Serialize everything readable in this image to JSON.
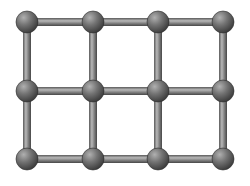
{
  "diagram": {
    "type": "square-lattice",
    "columns": 4,
    "rows": 3,
    "column_x": [
      27,
      93,
      158,
      223
    ],
    "row_y": [
      22,
      91,
      159
    ],
    "node_radius": 11,
    "bond_width": 8,
    "colors": {
      "background": "#ffffff",
      "node_light": "#a8a8a8",
      "node_mid": "#6e6e6e",
      "node_dark": "#3a3a3a",
      "bond_light": "#b4b4b4",
      "bond_mid": "#7c7c7c",
      "bond_dark": "#4a4a4a"
    }
  }
}
